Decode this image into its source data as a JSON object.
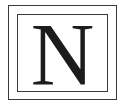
{
  "logo": {
    "letter": "N",
    "colors": {
      "stroke": "#3a3a3a",
      "letter": "#1c1c1c",
      "background": "#ffffff"
    }
  }
}
